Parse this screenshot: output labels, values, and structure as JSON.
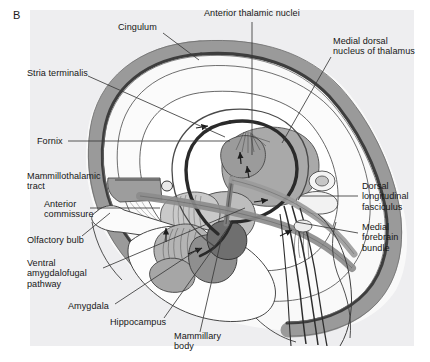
{
  "figure": {
    "panel_letter": "B",
    "panel_background": "#eeeef0",
    "page_background": "#ffffff",
    "width": 430,
    "height": 362
  },
  "palette": {
    "ink": "#161616",
    "cingulum_band": "#9a9a9a",
    "cingulum_stripe": "#3d3d3d",
    "cortex_fill": "#f7f7f7",
    "thalamus_fill": "#a9a9a9",
    "thalamus_dark": "#8e8e8e",
    "hypothalamus_fill": "#bdbdbd",
    "amygdala_fill": "#9d9d9d",
    "mammillary_fill": "#6f6f6f",
    "tract_gray": "#8c8c8c",
    "fornix_dark": "#2a2a2a",
    "leader_line": "#3a3a3a"
  },
  "labels": [
    {
      "id": "cingulum",
      "text": "Cingulum",
      "x": 118,
      "y": 28
    },
    {
      "id": "anterior-thalamic-nuclei",
      "text": "Anterior thalamic nuclei",
      "x": 204,
      "y": 13
    },
    {
      "id": "medial-dorsal-nucleus-of-thalamus",
      "text": "Medial dorsal\nnucleus of thalamus",
      "x": 333,
      "y": 41
    },
    {
      "id": "stria-terminalis",
      "text": "Stria terminalis",
      "x": 27,
      "y": 73
    },
    {
      "id": "fornix",
      "text": "Fornix",
      "x": 37,
      "y": 137
    },
    {
      "id": "mammillothalamic-tract",
      "text": "Mammillothalamic\ntract",
      "x": 27,
      "y": 176
    },
    {
      "id": "anterior-commissure",
      "text": "Anterior\ncommissure",
      "x": 44,
      "y": 204
    },
    {
      "id": "dorsal-longitudinal-fasciculus",
      "text": "Dorsal\nlongitudinal\nfasciculus",
      "x": 362,
      "y": 186
    },
    {
      "id": "olfactory-bulb",
      "text": "Olfactory bulb",
      "x": 27,
      "y": 240
    },
    {
      "id": "medial-forebrain-bundle",
      "text": "Medial\nforebrain\nbundle",
      "x": 362,
      "y": 227
    },
    {
      "id": "ventral-amygdalofugal-pathway",
      "text": "Ventral\namygdalofugal\npathway",
      "x": 27,
      "y": 263
    },
    {
      "id": "amygdala",
      "text": "Amygdala",
      "x": 68,
      "y": 306
    },
    {
      "id": "hippocampus",
      "text": "Hippocampus",
      "x": 110,
      "y": 322
    },
    {
      "id": "mammillary-body",
      "text": "Mammillary\nbody",
      "x": 174,
      "y": 336
    }
  ],
  "leader_lines": [
    {
      "id": "leader-cingulum",
      "from": [
        163,
        33
      ],
      "to": [
        199,
        60
      ]
    },
    {
      "id": "leader-anterior-thalamic-nuclei",
      "from": [
        252,
        22
      ],
      "to": [
        252,
        155
      ]
    },
    {
      "id": "leader-medial-dorsal",
      "from": [
        331,
        57
      ],
      "to": [
        282,
        143
      ]
    },
    {
      "id": "leader-stria-terminalis",
      "from": [
        88,
        76
      ],
      "to": [
        225,
        137
      ]
    },
    {
      "id": "leader-fornix",
      "from": [
        68,
        141
      ],
      "to": [
        230,
        141
      ]
    },
    {
      "id": "leader-mammillothalamic",
      "from": [
        115,
        180
      ],
      "to": [
        160,
        180
      ]
    },
    {
      "id": "leader-anterior-commissure",
      "from": [
        90,
        208
      ],
      "to": [
        160,
        208
      ]
    },
    {
      "id": "leader-dorsal-longitudinal",
      "from": [
        358,
        196
      ],
      "to": [
        300,
        196
      ]
    },
    {
      "id": "leader-medial-forebrain",
      "from": [
        358,
        233
      ],
      "to": [
        296,
        222
      ]
    },
    {
      "id": "leader-olfactory-bulb",
      "from": [
        82,
        236
      ],
      "to": [
        110,
        213
      ]
    },
    {
      "id": "leader-ventral-amygdalofugal",
      "from": [
        103,
        268
      ],
      "to": [
        245,
        208
      ]
    },
    {
      "id": "leader-amygdala",
      "from": [
        115,
        304
      ],
      "to": [
        200,
        248
      ]
    },
    {
      "id": "leader-hippocampus",
      "from": [
        164,
        318
      ],
      "to": [
        232,
        222
      ]
    },
    {
      "id": "leader-mammillary-body",
      "from": [
        200,
        332
      ],
      "to": [
        222,
        236
      ]
    }
  ],
  "flow_arrows": [
    {
      "id": "arrow-cingulate-forward",
      "x": 203,
      "y": 128,
      "dir": "right"
    },
    {
      "id": "arrow-fornix-descend",
      "x": 240,
      "y": 157,
      "dir": "up"
    },
    {
      "id": "arrow-thalamus-up",
      "x": 245,
      "y": 170,
      "dir": "up"
    },
    {
      "id": "arrow-mfb-caudal",
      "x": 262,
      "y": 200,
      "dir": "right"
    },
    {
      "id": "arrow-stria-ascend",
      "x": 166,
      "y": 234,
      "dir": "up"
    },
    {
      "id": "arrow-amygdalofugal",
      "x": 196,
      "y": 250,
      "dir": "right"
    },
    {
      "id": "arrow-brainstem",
      "x": 288,
      "y": 232,
      "dir": "right"
    }
  ]
}
